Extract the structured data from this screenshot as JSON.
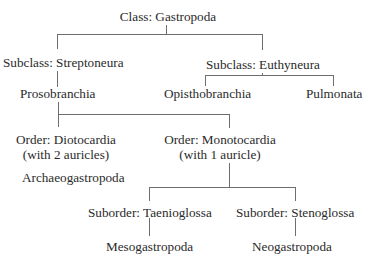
{
  "diagram": {
    "type": "taxonomy-tree",
    "nodes": {
      "class": {
        "label": "Class: Gastropoda"
      },
      "streptoneura": {
        "label": "Subclass: Streptoneura"
      },
      "euthyneura": {
        "label": "Subclass: Euthyneura"
      },
      "prosobranchia": {
        "label": "Prosobranchia"
      },
      "opisthobranchia": {
        "label": "Opisthobranchia"
      },
      "pulmonata": {
        "label": "Pulmonata"
      },
      "diotocardia": {
        "label": "Order: Diotocardia",
        "note": "(with 2 auricles)"
      },
      "monotocardia": {
        "label": "Order: Monotocardia",
        "note": "(with 1 auricle)"
      },
      "archaeogastropoda": {
        "label": "Archaeogastropoda"
      },
      "taenioglossa": {
        "label": "Suborder: Taenioglossa"
      },
      "stenoglossa": {
        "label": "Suborder: Stenoglossa"
      },
      "mesogastropoda": {
        "label": "Mesogastropoda"
      },
      "neogastropoda": {
        "label": "Neogastropoda"
      }
    },
    "edges": [
      [
        "class",
        "streptoneura"
      ],
      [
        "class",
        "euthyneura"
      ],
      [
        "streptoneura",
        "prosobranchia"
      ],
      [
        "euthyneura",
        "opisthobranchia"
      ],
      [
        "euthyneura",
        "pulmonata"
      ],
      [
        "prosobranchia",
        "diotocardia"
      ],
      [
        "prosobranchia",
        "monotocardia"
      ],
      [
        "diotocardia",
        "archaeogastropoda"
      ],
      [
        "monotocardia",
        "taenioglossa"
      ],
      [
        "monotocardia",
        "stenoglossa"
      ],
      [
        "taenioglossa",
        "mesogastropoda"
      ],
      [
        "stenoglossa",
        "neogastropoda"
      ]
    ]
  }
}
